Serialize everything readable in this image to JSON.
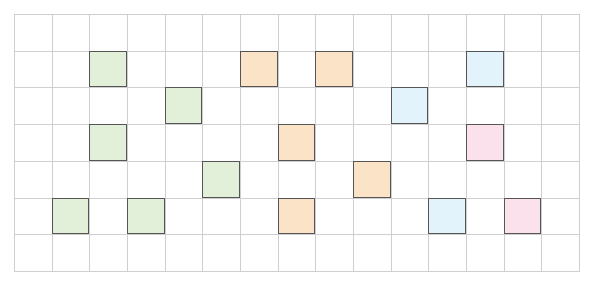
{
  "grid": {
    "columns": 15,
    "rows": 7,
    "line_color": "#cfcfcf",
    "filled_border_color": "#555555"
  },
  "colors": {
    "green": "#e2f0d9",
    "orange": "#fae3c6",
    "blue": "#e3f3fb",
    "pink": "#fbe1ec"
  },
  "filled_cells": [
    {
      "col": 2,
      "row": 1,
      "color": "green"
    },
    {
      "col": 4,
      "row": 2,
      "color": "green"
    },
    {
      "col": 2,
      "row": 3,
      "color": "green"
    },
    {
      "col": 5,
      "row": 4,
      "color": "green"
    },
    {
      "col": 1,
      "row": 5,
      "color": "green"
    },
    {
      "col": 3,
      "row": 5,
      "color": "green"
    },
    {
      "col": 6,
      "row": 1,
      "color": "orange"
    },
    {
      "col": 8,
      "row": 1,
      "color": "orange"
    },
    {
      "col": 7,
      "row": 3,
      "color": "orange"
    },
    {
      "col": 9,
      "row": 4,
      "color": "orange"
    },
    {
      "col": 7,
      "row": 5,
      "color": "orange"
    },
    {
      "col": 12,
      "row": 1,
      "color": "blue"
    },
    {
      "col": 10,
      "row": 2,
      "color": "blue"
    },
    {
      "col": 11,
      "row": 5,
      "color": "blue"
    },
    {
      "col": 12,
      "row": 3,
      "color": "pink"
    },
    {
      "col": 13,
      "row": 5,
      "color": "pink"
    }
  ]
}
